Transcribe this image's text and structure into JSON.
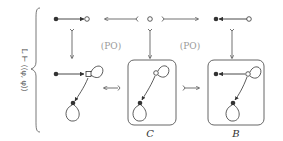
{
  "diagram": {
    "side_label": "L ⊢ ⟨⟨φ, φ⟩⟩",
    "po_labels": [
      "(PO)",
      "(PO)"
    ],
    "object_labels": {
      "bottom_middle": "C",
      "bottom_right": "B"
    },
    "colors": {
      "stroke": "#333333",
      "label_gray": "#9a9a9a",
      "box": "#555555"
    }
  }
}
